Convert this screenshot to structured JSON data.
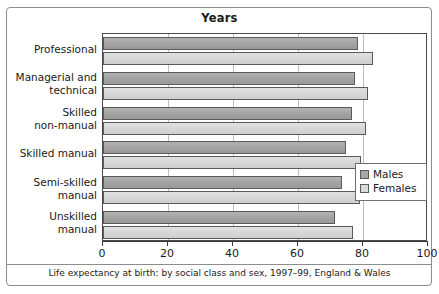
{
  "chart_data": {
    "type": "bar",
    "orientation": "horizontal",
    "title": "Years",
    "caption": "Life expectancy at birth: by social class and sex, 1997–99, England & Wales",
    "xlabel": "Years",
    "ylabel": "",
    "xlim": [
      0,
      100
    ],
    "xticks": [
      "0",
      "20",
      "40",
      "60",
      "80",
      "100"
    ],
    "xtick_values": [
      0,
      20,
      40,
      60,
      80,
      100
    ],
    "grid": "vertical",
    "legend_position": "middle-right",
    "categories": [
      "Professional",
      "Managerial and technical",
      "Skilled non-manual",
      "Skilled manual",
      "Semi-skilled manual",
      "Unskilled manual"
    ],
    "category_lines": [
      [
        "Professional"
      ],
      [
        "Managerial and",
        "technical"
      ],
      [
        "Skilled",
        "non-manual"
      ],
      [
        "Skilled manual"
      ],
      [
        "Semi-skilled",
        "manual"
      ],
      [
        "Unskilled",
        "manual"
      ]
    ],
    "series": [
      {
        "name": "Males",
        "color": "#a8a8a8",
        "values": [
          78.5,
          77.5,
          76.5,
          74.7,
          73.5,
          71.5
        ]
      },
      {
        "name": "Females",
        "color": "#dadada",
        "values": [
          83.0,
          81.5,
          81.0,
          79.5,
          79.0,
          77.0
        ]
      }
    ]
  },
  "legend": {
    "items": [
      {
        "label": "Males",
        "swatch": "males-swatch"
      },
      {
        "label": "Females",
        "swatch": "females-swatch"
      }
    ]
  }
}
